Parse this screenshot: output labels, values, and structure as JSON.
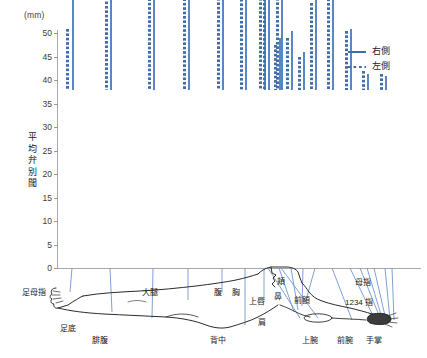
{
  "chart_data": {
    "type": "bar",
    "title": "",
    "unit_label": "(mm)",
    "ylabel": "平均弁別閾",
    "xlabel": "",
    "ylim": [
      0,
      50
    ],
    "yticks": [
      0,
      5,
      10,
      15,
      20,
      25,
      30,
      35,
      40,
      45,
      50
    ],
    "grid": false,
    "legend_position": "top-right",
    "categories": [
      "足母指",
      "足底",
      "腓腹",
      "大腿",
      "腹",
      "背中",
      "胸",
      "上唇",
      "鼻",
      "頬",
      "前額",
      "肩",
      "上腕",
      "前腕",
      "手掌",
      "母指",
      "1234 指"
    ],
    "series": [
      {
        "name": "右側",
        "style": "solid",
        "color": "#3f6ea8",
        "values": [
          22.5,
          46.0,
          44.0,
          33.0,
          41.5,
          45.0,
          42.0,
          11.0,
          12.5,
          8.0,
          20.5,
          42.0,
          42.0,
          41.0,
          13.0,
          3.5,
          3.0
        ]
      },
      {
        "name": "左側",
        "style": "dotted",
        "color": "#3f6ea8",
        "values": [
          13.0,
          44.0,
          42.0,
          32.5,
          41.0,
          45.5,
          41.0,
          9.5,
          11.0,
          7.0,
          18.5,
          40.0,
          41.0,
          40.0,
          12.5,
          4.0,
          3.5
        ]
      }
    ]
  },
  "legend": {
    "items": [
      {
        "label": "右側",
        "style": "solid"
      },
      {
        "label": "左側",
        "style": "dotted"
      }
    ]
  },
  "axis": {
    "unit": "(mm)",
    "title": "平均弁別閾",
    "ticks": [
      "50",
      "45",
      "40",
      "35",
      "30",
      "25",
      "20",
      "15",
      "10",
      "5",
      "0"
    ]
  },
  "body_labels": [
    {
      "id": "ashi-boshi",
      "text": "足母指"
    },
    {
      "id": "ashiura",
      "text": "足底"
    },
    {
      "id": "hifuku",
      "text": "腓腹"
    },
    {
      "id": "daitai",
      "text": "大腿"
    },
    {
      "id": "hara",
      "text": "腹"
    },
    {
      "id": "senaka",
      "text": "背中"
    },
    {
      "id": "mune",
      "text": "胸"
    },
    {
      "id": "kata",
      "text": "肩"
    },
    {
      "id": "jouwan",
      "text": "上腕"
    },
    {
      "id": "zenwan-low",
      "text": "前腕"
    },
    {
      "id": "joushin",
      "text": "上唇"
    },
    {
      "id": "hana",
      "text": "鼻"
    },
    {
      "id": "hoho",
      "text": "頬"
    },
    {
      "id": "zengaku",
      "text": "前額"
    },
    {
      "id": "boshi",
      "text": "母指"
    },
    {
      "id": "yubi1234",
      "text": "1234 指"
    },
    {
      "id": "shusho",
      "text": "手掌"
    }
  ]
}
